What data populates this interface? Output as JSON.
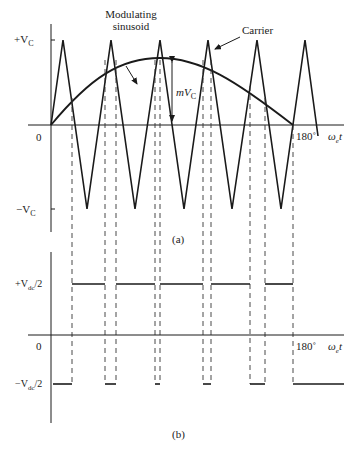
{
  "figure": {
    "panel_a": {
      "caption": "(a)",
      "annotations": {
        "modulating_line1": "Modulating",
        "modulating_line2": "sinusoid",
        "carrier": "Carrier",
        "amplitude": "mV",
        "amplitude_sub": "C"
      },
      "y_ticks": {
        "top": "+V",
        "top_sub": "C",
        "zero": "0",
        "bottom": "−V",
        "bottom_sub": "C"
      },
      "x_tick_end": "180˚",
      "x_axis_label": "ω",
      "x_axis_label_sub": "e",
      "x_axis_label_t": "t"
    },
    "panel_b": {
      "caption": "(b)",
      "y_ticks": {
        "top": "+V",
        "top_sub": "dc",
        "top_suffix": "/2",
        "zero": "0",
        "bottom": "−V",
        "bottom_sub": "dc",
        "bottom_suffix": "/2"
      },
      "x_tick_end": "180˚",
      "x_axis_label": "ω",
      "x_axis_label_sub": "e",
      "x_axis_label_t": "t"
    },
    "colors": {
      "line": "#1a1a1a",
      "background": "#ffffff"
    }
  }
}
